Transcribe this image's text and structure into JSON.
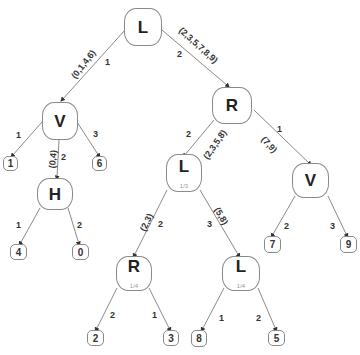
{
  "tree": {
    "nodes": {
      "root": {
        "label": "L",
        "sub": ""
      },
      "v_left": {
        "label": "V",
        "sub": ""
      },
      "h": {
        "label": "H",
        "sub": ""
      },
      "r_mid": {
        "label": "R",
        "sub": ""
      },
      "l_mid": {
        "label": "L",
        "sub": "1/3"
      },
      "v_right": {
        "label": "V",
        "sub": ""
      },
      "r_low": {
        "label": "R",
        "sub": "1/4"
      },
      "l_low": {
        "label": "L",
        "sub": "1/4"
      }
    },
    "leaves": {
      "leaf_1": "1",
      "leaf_6": "6",
      "leaf_4": "4",
      "leaf_0": "0",
      "leaf_7": "7",
      "leaf_9": "9",
      "leaf_2": "2",
      "leaf_3": "3",
      "leaf_8": "8",
      "leaf_5": "5"
    },
    "edges": {
      "root_vleft": {
        "branch": "1",
        "set": "(0,1,4,6)"
      },
      "root_rmid": {
        "branch": "2",
        "set": "(2,3,5,7,8,9)"
      },
      "vleft_leaf1": {
        "branch": "1"
      },
      "vleft_h": {
        "branch": "2",
        "set": "(0,4)"
      },
      "vleft_leaf6": {
        "branch": "3"
      },
      "h_leaf4": {
        "branch": "1"
      },
      "h_leaf0": {
        "branch": "2"
      },
      "rmid_lmid": {
        "branch": "2",
        "set": "(2,3,5,8)"
      },
      "rmid_vright": {
        "branch": "1",
        "set": "(7,9)"
      },
      "lmid_rlow": {
        "branch": "2",
        "set": "(2,3)"
      },
      "lmid_llow": {
        "branch": "3",
        "set": "(5,8)"
      },
      "vright_leaf7": {
        "branch": "2"
      },
      "vright_leaf9": {
        "branch": "3"
      },
      "rlow_leaf2": {
        "branch": "2"
      },
      "rlow_leaf3": {
        "branch": "1"
      },
      "llow_leaf8": {
        "branch": "1"
      },
      "llow_leaf5": {
        "branch": "2"
      }
    }
  }
}
